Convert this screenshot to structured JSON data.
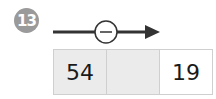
{
  "problem": {
    "number": "13",
    "operation_symbol": "−",
    "operation": "minus",
    "cells": [
      {
        "value": "54",
        "shaded": true
      },
      {
        "value": "",
        "shaded": true
      },
      {
        "value": "19",
        "shaded": false
      }
    ]
  },
  "colors": {
    "badge": "#9a9a9a",
    "shaded_cell": "#ebebeb",
    "arrow": "#333333"
  }
}
